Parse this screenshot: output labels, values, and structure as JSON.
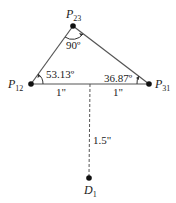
{
  "diagram": {
    "points": [
      {
        "id": "P12",
        "label": "P",
        "sub": "12",
        "x": 31,
        "y": 84
      },
      {
        "id": "P23",
        "label": "P",
        "sub": "23",
        "x": 73,
        "y": 26
      },
      {
        "id": "P31",
        "label": "P",
        "sub": "31",
        "x": 149,
        "y": 84
      },
      {
        "id": "D1",
        "label": "D",
        "sub": "1",
        "x": 89,
        "y": 178
      }
    ],
    "angles": {
      "p23": "90º",
      "p12": "53.13º",
      "p31": "36.87º"
    },
    "dimensions": {
      "left_segment": "1\"",
      "right_segment": "1\"",
      "vertical": "1.5\""
    },
    "colors": {
      "line": "#555555",
      "point": "#111111",
      "text": "#222222"
    }
  }
}
